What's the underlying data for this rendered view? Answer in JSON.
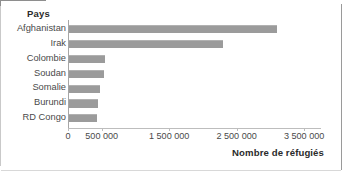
{
  "chart_data": {
    "type": "bar",
    "orientation": "horizontal",
    "title": "",
    "category_header": "Pays",
    "xlabel": "Nombre de réfugiés",
    "ylabel": "",
    "categories": [
      "Afghanistan",
      "Irak",
      "Colombie",
      "Soudan",
      "Somalie",
      "Burundi",
      "RD Congo"
    ],
    "values": [
      3100000,
      2300000,
      550000,
      530000,
      480000,
      440000,
      430000
    ],
    "xlim": [
      0,
      3750000
    ],
    "xticks": [
      0,
      500000,
      1500000,
      2500000,
      3500000
    ],
    "xtick_labels": [
      "0",
      "500 000",
      "1 500 000",
      "2 500 000",
      "3 500 000"
    ],
    "grid": false,
    "legend": null,
    "bar_color": "#9b9b9b",
    "axis_color": "#b0b0b0",
    "text_color": "#4a4a4a"
  },
  "colors": {
    "background": "#ffffff",
    "bar": "#9b9b9b",
    "axis": "#b0b0b0",
    "label": "#4a4a4a",
    "heading": "#2b2b2b"
  }
}
